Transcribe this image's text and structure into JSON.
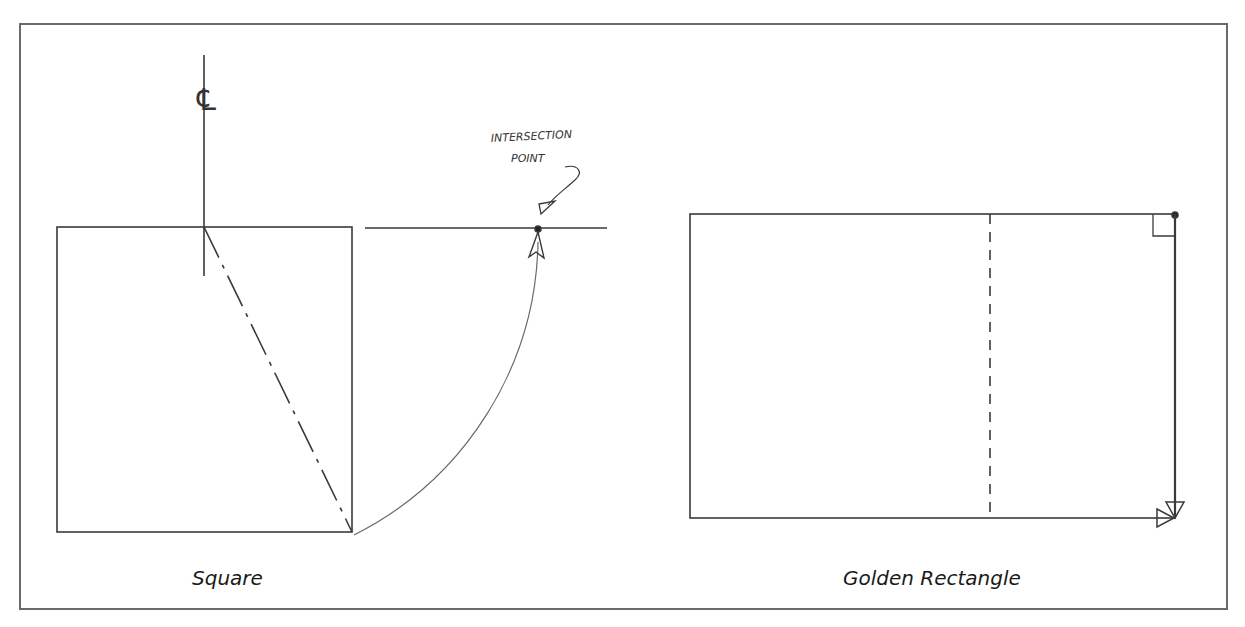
{
  "figure": {
    "left_panel": {
      "caption": "Square",
      "centerline_symbol": "℄",
      "annotation": {
        "line1": "INTERSECTION",
        "line2": "POINT"
      }
    },
    "right_panel": {
      "caption": "Golden Rectangle"
    }
  },
  "colors": {
    "frame": "#6a6a6a",
    "stroke": "#3a3a3a",
    "background": "#ffffff"
  }
}
